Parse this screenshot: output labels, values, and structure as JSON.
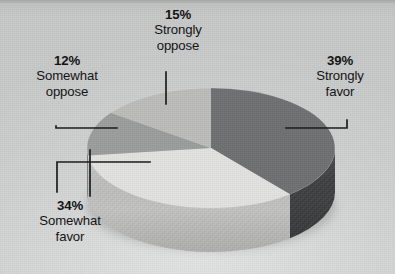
{
  "chart_data": {
    "type": "pie",
    "title": "",
    "subtitle": "",
    "xlabel": "",
    "ylabel": "",
    "legend_position": "none",
    "grid": false,
    "three_d": true,
    "units": "percent",
    "categories": [
      "Strongly favor",
      "Somewhat favor",
      "Somewhat oppose",
      "Strongly oppose"
    ],
    "values": [
      39,
      34,
      12,
      15
    ],
    "slices": [
      {
        "name": "strongly-favor",
        "label": "Strongly favor",
        "percent_text": "39%",
        "value": 39,
        "color": "#6f7071",
        "side_color": "#3c3d3e",
        "label_position": "right"
      },
      {
        "name": "somewhat-favor",
        "label": "Somewhat favor",
        "percent_text": "34%",
        "value": 34,
        "color": "#e2e2e0",
        "side_color": "#c2c3c1",
        "label_position": "bottom-left"
      },
      {
        "name": "somewhat-oppose",
        "label": "Somewhat oppose",
        "percent_text": "12%",
        "value": 12,
        "color": "#9b9c9c",
        "side_color": "#7e7f7f",
        "label_position": "left"
      },
      {
        "name": "strongly-oppose",
        "label": "Strongly oppose",
        "percent_text": "15%",
        "value": 15,
        "color": "#bcbdbb",
        "side_color": "#9fa09e",
        "label_position": "top"
      }
    ],
    "background_color": "#c9c9c9",
    "label_text_color": "#141414",
    "leader_line_color": "#1a1a1a"
  },
  "labels": {
    "strongly_oppose": {
      "percent": "15%",
      "line1": "Strongly",
      "line2": "oppose"
    },
    "somewhat_oppose": {
      "percent": "12%",
      "line1": "Somewhat",
      "line2": "oppose"
    },
    "strongly_favor": {
      "percent": "39%",
      "line1": "Strongly",
      "line2": "favor"
    },
    "somewhat_favor": {
      "percent": "34%",
      "line1": "Somewhat",
      "line2": "favor"
    }
  }
}
